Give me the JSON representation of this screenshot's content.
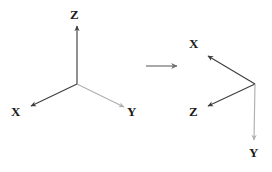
{
  "canvas": {
    "width": 272,
    "height": 172,
    "background_color": "#ffffff"
  },
  "colors": {
    "dark_axis": "#3f3f3f",
    "light_axis": "#b0b0b0",
    "transition_arrow": "#707070",
    "label_text": "#1a1a1a"
  },
  "left_frame": {
    "name": "original-coordinate-frame",
    "origin": {
      "x": 77,
      "y": 84
    },
    "axes": [
      {
        "label": "Z",
        "icon": "arrow-up-icon",
        "color": "#3f3f3f",
        "from": {
          "x": 77,
          "y": 84
        },
        "to": {
          "x": 77,
          "y": 26
        },
        "label_position": {
          "x": 70,
          "y": 8
        }
      },
      {
        "label": "X",
        "icon": "arrow-down-left-icon",
        "color": "#3f3f3f",
        "from": {
          "x": 77,
          "y": 84
        },
        "to": {
          "x": 31,
          "y": 106
        },
        "label_position": {
          "x": 11,
          "y": 105
        }
      },
      {
        "label": "Y",
        "icon": "arrow-down-right-icon",
        "color": "#b0b0b0",
        "from": {
          "x": 77,
          "y": 84
        },
        "to": {
          "x": 124,
          "y": 107
        },
        "label_position": {
          "x": 127,
          "y": 105
        }
      }
    ]
  },
  "transition": {
    "name": "transition-arrow",
    "icon": "arrow-right-icon",
    "color": "#707070",
    "from": {
      "x": 146,
      "y": 66
    },
    "to": {
      "x": 177,
      "y": 66
    }
  },
  "right_frame": {
    "name": "transformed-coordinate-frame",
    "origin": {
      "x": 255,
      "y": 84
    },
    "axes": [
      {
        "label": "X",
        "icon": "arrow-up-left-icon",
        "color": "#3f3f3f",
        "from": {
          "x": 255,
          "y": 84
        },
        "to": {
          "x": 208,
          "y": 56
        },
        "label_position": {
          "x": 189,
          "y": 37
        }
      },
      {
        "label": "Z",
        "icon": "arrow-down-left-icon",
        "color": "#3f3f3f",
        "from": {
          "x": 255,
          "y": 84
        },
        "to": {
          "x": 208,
          "y": 106
        },
        "label_position": {
          "x": 189,
          "y": 105
        }
      },
      {
        "label": "Y",
        "icon": "arrow-down-icon",
        "color": "#b0b0b0",
        "from": {
          "x": 255,
          "y": 84
        },
        "to": {
          "x": 254,
          "y": 140
        },
        "label_position": {
          "x": 249,
          "y": 146
        }
      }
    ]
  }
}
